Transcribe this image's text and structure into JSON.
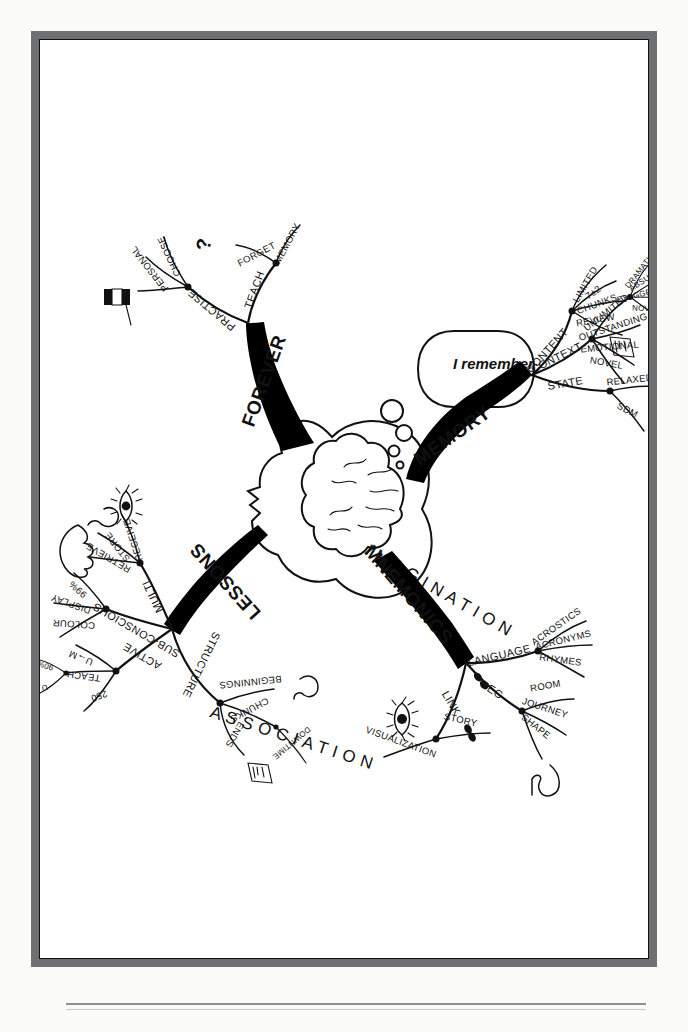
{
  "document": {
    "type": "mind-map",
    "title": "Memory Mind Map",
    "center_image": "head-profile-with-brain",
    "thought_bubble": "I remember"
  },
  "ghost_words": [
    {
      "text": "I M A G I N A T I O N",
      "name": "ghost-word-imagination"
    },
    {
      "text": "A S S O C I A T I O N",
      "name": "ghost-word-association"
    }
  ],
  "branches": [
    {
      "id": "memory",
      "label": "MEMORY",
      "children": [
        {
          "label": "CONTENT",
          "children": [
            {
              "label": "LIMITED"
            },
            {
              "label": "7±2"
            },
            {
              "label": "CHUNKS"
            },
            {
              "label": "REVIEW",
              "icon": "clock-icon"
            }
          ]
        },
        {
          "label": "CONTEXT",
          "children": [
            {
              "label": "UNLIMITED"
            },
            {
              "label": "OUTSTANDING",
              "children": [
                {
                  "label": "DRAMATIC"
                },
                {
                  "label": "ABSURD"
                },
                {
                  "label": "EXAGGERATED"
                },
                {
                  "label": "NOVEL"
                }
              ]
            },
            {
              "label": "EMOTIONAL"
            },
            {
              "label": "NOVEL"
            }
          ]
        },
        {
          "label": "STATE",
          "children": [
            {
              "label": "RELAXED",
              "icons": [
                "star-person-icon",
                "smiley-icon",
                "music-note-icon"
              ],
              "children": [
                {
                  "label": "BREATH"
                }
              ]
            },
            {
              "label": "SDM"
            }
          ]
        }
      ]
    },
    {
      "id": "mnemonics",
      "label": "MNEMONICS",
      "children": [
        {
          "label": "LANGUAGE",
          "children": [
            {
              "label": "ACROSTICS"
            },
            {
              "label": "ACRONYMS"
            },
            {
              "label": "RHYMES"
            }
          ]
        },
        {
          "label": "PEG",
          "icon": "chain-link-icon",
          "children": [
            {
              "label": "ROOM"
            },
            {
              "label": "JOURNEY"
            },
            {
              "label": "SHAPE",
              "icon": "swan-two-icon"
            }
          ]
        },
        {
          "label": "LINK",
          "icon": "chain-link-icon",
          "children": [
            {
              "label": "STORY"
            },
            {
              "label": "VISUALIZATION",
              "icon": "eye-icon"
            }
          ]
        }
      ]
    },
    {
      "id": "forever",
      "label": "FOREVER",
      "children": [
        {
          "label": "TEACH",
          "children": [
            {
              "label": "MEMORY"
            },
            {
              "label": "FORGET"
            }
          ]
        },
        {
          "label": "PRACTISE",
          "icon": "question-mark-icon",
          "children": [
            {
              "label": "CHOOSE"
            },
            {
              "label": "PERSONAL"
            },
            {
              "label": "",
              "icon": "book-icon"
            }
          ]
        }
      ]
    },
    {
      "id": "lessons",
      "label": "LESSONS",
      "children": [
        {
          "label": "MULTI",
          "children": [
            {
              "label": "RECEIVE",
              "icon": "eye-icon"
            },
            {
              "label": "STORE",
              "icon": "ear-icon"
            },
            {
              "label": "RETRIEVE",
              "icon": "hand-icon"
            }
          ]
        },
        {
          "label": "SUB-CONSCIOUS",
          "children": [
            {
              "label": "99%"
            },
            {
              "label": "DISPLAY"
            },
            {
              "label": "COLOUR"
            }
          ]
        },
        {
          "label": "ACTIVE",
          "children": [
            {
              "label": "U→M"
            },
            {
              "label": "TEACH",
              "children": [
                {
                  "label": "90%"
                },
                {
                  "label": "U"
                }
              ]
            },
            {
              "label": "250"
            }
          ]
        },
        {
          "label": "STRUCTURE",
          "children": [
            {
              "label": "BEGINNINGS",
              "icon": "sleep-icon"
            },
            {
              "label": "CHUNKS",
              "children": [
                {
                  "label": "DOWNTIME"
                }
              ]
            },
            {
              "label": "ENDS",
              "icon": "clock-icon"
            }
          ]
        }
      ]
    }
  ],
  "colors": {
    "frame": "#6f7072",
    "ink": "#111111",
    "paper": "#ffffff",
    "page": "#fbfbfa"
  }
}
